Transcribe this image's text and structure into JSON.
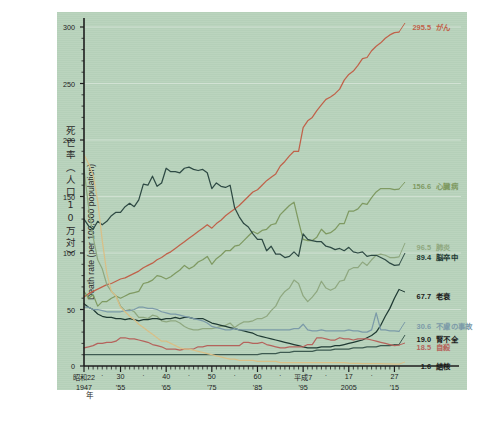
{
  "figure": {
    "background_color": "#b7d2bb",
    "page_color": "#ffffff"
  },
  "axes": {
    "y_label_jp": "死亡率（人口10万対）",
    "y_label_en": "Death rate (per 100,000 population)",
    "y_ticks": [
      "0",
      "50",
      "100",
      "150",
      "200",
      "250",
      "300"
    ],
    "y_min": 0,
    "y_max": 300,
    "x_label_jp": "年",
    "x_ticks_top": [
      "昭和22",
      "30",
      "40",
      "50",
      "60",
      "平成7",
      "17",
      "27"
    ],
    "x_ticks_bottom": [
      "1947",
      "'55",
      "'65",
      "'75",
      "'85",
      "'95",
      "2005",
      "'15"
    ],
    "x_tick_years": [
      1947,
      1955,
      1965,
      1975,
      1985,
      1995,
      2005,
      2015
    ],
    "x_min": 1947,
    "x_max": 2016,
    "minor_dot": "·"
  },
  "chart_data": {
    "type": "line",
    "title": "",
    "xlabel": "年",
    "ylabel": "死亡率（人口10万対） / Death rate (per 100,000 population)",
    "ylim": [
      0,
      300
    ],
    "xlim": [
      1947,
      2016
    ],
    "grid": true,
    "legend_position": "right-inline-end-labels",
    "x": [
      1947,
      1948,
      1949,
      1950,
      1951,
      1952,
      1953,
      1954,
      1955,
      1956,
      1957,
      1958,
      1959,
      1960,
      1961,
      1962,
      1963,
      1964,
      1965,
      1966,
      1967,
      1968,
      1969,
      1970,
      1971,
      1972,
      1973,
      1974,
      1975,
      1976,
      1977,
      1978,
      1979,
      1980,
      1981,
      1982,
      1983,
      1984,
      1985,
      1986,
      1987,
      1988,
      1989,
      1990,
      1991,
      1992,
      1993,
      1994,
      1995,
      1996,
      1997,
      1998,
      1999,
      2000,
      2001,
      2002,
      2003,
      2004,
      2005,
      2006,
      2007,
      2008,
      2009,
      2010,
      2011,
      2012,
      2013,
      2014,
      2015,
      2016
    ],
    "series": [
      {
        "name": "がん",
        "name_en": "cancer",
        "color": "#c0624a",
        "end_value": 295.5,
        "values": [
          61,
          64,
          66,
          68,
          70,
          72,
          73,
          75,
          77,
          78,
          80,
          82,
          84,
          87,
          89,
          91,
          94,
          96,
          99,
          101,
          104,
          107,
          110,
          113,
          116,
          119,
          122,
          125,
          122,
          126,
          129,
          133,
          136,
          139,
          142,
          146,
          150,
          154,
          156,
          160,
          164,
          167,
          170,
          177,
          181,
          186,
          190,
          190,
          211,
          217,
          220,
          226,
          231,
          236,
          238,
          241,
          245,
          253,
          258,
          261,
          266,
          272,
          273,
          279,
          283,
          286,
          290,
          293,
          295,
          295.5
        ]
      },
      {
        "name": "心臓病",
        "name_en": "heart disease",
        "color": "#7f9a62",
        "end_value": 156.6,
        "values": [
          66,
          60,
          63,
          53,
          57,
          57,
          60,
          62,
          60,
          62,
          64,
          65,
          66,
          73,
          74,
          76,
          80,
          79,
          77,
          79,
          82,
          85,
          89,
          86,
          88,
          92,
          94,
          97,
          90,
          95,
          98,
          102,
          102,
          106,
          107,
          111,
          115,
          119,
          117,
          120,
          121,
          125,
          126,
          134,
          138,
          142,
          145,
          128,
          112,
          111,
          111,
          114,
          121,
          117,
          118,
          121,
          126,
          126,
          137,
          137,
          139,
          144,
          143,
          149,
          154,
          157,
          157,
          157,
          156,
          156.6
        ]
      },
      {
        "name": "肺炎",
        "name_en": "pneumonia",
        "color": "#8fa880",
        "end_value": 96.5,
        "values": [
          174,
          141,
          114,
          94,
          86,
          72,
          66,
          62,
          53,
          49,
          50,
          48,
          43,
          43,
          42,
          45,
          44,
          40,
          39,
          40,
          40,
          38,
          35,
          33,
          32,
          32,
          33,
          33,
          33,
          34,
          35,
          36,
          38,
          34,
          37,
          39,
          39,
          40,
          42,
          42,
          44,
          49,
          53,
          61,
          66,
          69,
          76,
          73,
          62,
          57,
          61,
          66,
          75,
          69,
          67,
          69,
          75,
          76,
          85,
          87,
          87,
          92,
          89,
          94,
          98,
          99,
          98,
          96,
          96,
          96.5
        ]
      },
      {
        "name": "脳卒中",
        "name_en": "cerebrovascular disease",
        "color": "#2e4a44",
        "end_value": 89.4,
        "values": [
          130,
          124,
          121,
          128,
          125,
          128,
          133,
          136,
          136,
          141,
          144,
          141,
          147,
          161,
          160,
          168,
          159,
          162,
          175,
          172,
          172,
          171,
          175,
          176,
          174,
          173,
          174,
          171,
          157,
          162,
          159,
          158,
          160,
          140,
          132,
          126,
          123,
          117,
          112,
          112,
          102,
          106,
          99,
          99,
          96,
          97,
          101,
          97,
          117,
          112,
          111,
          110,
          110,
          106,
          105,
          103,
          104,
          102,
          105,
          101,
          100,
          101,
          97,
          98,
          98,
          96,
          94,
          91,
          89,
          89.4
        ]
      },
      {
        "name": "老衰",
        "name_en": "senility",
        "color": "#1f3a33",
        "end_value": 67.7,
        "values": [
          55,
          52,
          50,
          46,
          44,
          43,
          43,
          42,
          42,
          41,
          42,
          41,
          40,
          41,
          41,
          42,
          42,
          41,
          42,
          42,
          43,
          42,
          43,
          43,
          42,
          42,
          42,
          40,
          38,
          37,
          36,
          35,
          34,
          33,
          32,
          31,
          30,
          29,
          27,
          26,
          25,
          24,
          23,
          22,
          21,
          20,
          19,
          18,
          17,
          16,
          16,
          16,
          17,
          17,
          17,
          18,
          18,
          19,
          20,
          21,
          22,
          23,
          25,
          27,
          30,
          36,
          44,
          51,
          60,
          67.7
        ]
      },
      {
        "name": "不慮の事故",
        "name_en": "accidents",
        "color": "#7b9aa8",
        "end_value": 30.6,
        "values": [
          52,
          52,
          50,
          50,
          49,
          48,
          48,
          48,
          48,
          49,
          49,
          50,
          52,
          52,
          51,
          51,
          50,
          48,
          47,
          46,
          46,
          45,
          44,
          43,
          42,
          41,
          40,
          38,
          35,
          34,
          33,
          32,
          32,
          33,
          32,
          32,
          32,
          32,
          32,
          32,
          32,
          32,
          32,
          32,
          32,
          32,
          33,
          33,
          37,
          32,
          31,
          31,
          32,
          31,
          31,
          31,
          31,
          31,
          32,
          31,
          31,
          30,
          30,
          32,
          47,
          32,
          32,
          31,
          31,
          30.6
        ]
      },
      {
        "name": "腎不全",
        "name_en": "renal failure",
        "color": "#3d5a50",
        "end_value": 19.0,
        "values": [
          10,
          10,
          10,
          10,
          10,
          10,
          10,
          10,
          10,
          10,
          10,
          10,
          10,
          10,
          10,
          10,
          10,
          10,
          10,
          10,
          10,
          10,
          10,
          10,
          10,
          10,
          10,
          10,
          10,
          10,
          10,
          10,
          10,
          10,
          10,
          10,
          10,
          10,
          10,
          11,
          11,
          11,
          11,
          12,
          12,
          12,
          13,
          13,
          13,
          13,
          13,
          14,
          14,
          14,
          14,
          15,
          15,
          15,
          15,
          16,
          16,
          16,
          17,
          17,
          17,
          18,
          18,
          18,
          19,
          19.0
        ]
      },
      {
        "name": "自殺",
        "name_en": "suicide",
        "color": "#b5635c",
        "end_value": 18.5,
        "values": [
          16,
          17,
          18,
          20,
          20,
          21,
          21,
          22,
          25,
          25,
          24,
          24,
          23,
          22,
          21,
          19,
          18,
          17,
          15,
          15,
          15,
          14,
          15,
          15,
          15,
          17,
          17,
          18,
          18,
          18,
          18,
          18,
          18,
          18,
          18,
          21,
          21,
          20,
          20,
          21,
          19,
          18,
          17,
          16,
          16,
          17,
          17,
          17,
          17,
          19,
          19,
          25,
          25,
          24,
          23,
          23,
          25,
          24,
          24,
          23,
          24,
          24,
          24,
          23,
          22,
          21,
          20,
          19,
          18,
          18.5
        ]
      },
      {
        "name": "結核",
        "name_en": "tuberculosis",
        "color": "#d8bf87",
        "end_value": 1.6,
        "values": [
          187,
          179,
          169,
          146,
          111,
          82,
          66,
          62,
          52,
          48,
          44,
          41,
          37,
          34,
          31,
          28,
          25,
          22,
          22,
          20,
          18,
          16,
          15,
          15,
          14,
          13,
          12,
          11,
          10,
          9,
          8,
          7,
          6,
          6,
          5,
          5,
          5,
          5,
          4,
          4,
          4,
          4,
          4,
          3,
          3,
          3,
          3,
          3,
          3,
          3,
          3,
          3,
          3,
          3,
          3,
          3,
          3,
          3,
          2.5,
          2.4,
          2.3,
          2.2,
          2.2,
          2.1,
          2.1,
          2.0,
          1.9,
          1.8,
          1.7,
          1.6
        ]
      }
    ]
  },
  "end_labels": [
    {
      "value": "295.5",
      "name": "がん",
      "color": "#c0624a",
      "bold_value": true,
      "y": 26
    },
    {
      "value": "156.6",
      "name": "心臓病",
      "color": "#7f9a62",
      "bold_value": true,
      "y": 185
    },
    {
      "value": "96.5",
      "name": "肺炎",
      "color": "#8fa880",
      "bold_value": false,
      "y": 246
    },
    {
      "value": "89.4",
      "name": "脳卒中",
      "color": "#1e3a33",
      "bold_value": true,
      "y": 256
    },
    {
      "value": "67.7",
      "name": "老衰",
      "color": "#1a1a1a",
      "bold_value": true,
      "y": 295
    },
    {
      "value": "30.6",
      "name": "不慮の事故",
      "color": "#7b9aa8",
      "bold_value": false,
      "y": 325
    },
    {
      "value": "19.0",
      "name": "腎不全",
      "color": "#1a1a1a",
      "bold_value": true,
      "y": 338
    },
    {
      "value": "18.5",
      "name": "自殺",
      "color": "#b5635c",
      "bold_value": false,
      "y": 346
    },
    {
      "value": "1.6",
      "name": "結核",
      "color": "#1a1a1a",
      "bold_value": true,
      "y": 365
    }
  ]
}
